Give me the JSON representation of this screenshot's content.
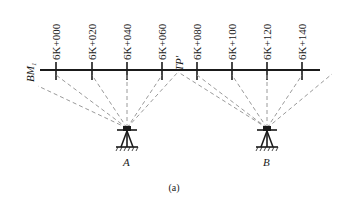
{
  "diagram": {
    "caption": "(a)",
    "benchmark_label": "BM",
    "benchmark_subscript": "1",
    "turning_point_label": "TP'",
    "stations": [
      {
        "label": "6K+000",
        "x": 56
      },
      {
        "label": "6K+020",
        "x": 92
      },
      {
        "label": "6K+040",
        "x": 127
      },
      {
        "label": "6K+060",
        "x": 162
      },
      {
        "label": "6K+080",
        "x": 197
      },
      {
        "label": "6K+100",
        "x": 232
      },
      {
        "label": "6K+120",
        "x": 267
      },
      {
        "label": "6K+140",
        "x": 302
      }
    ],
    "instruments": [
      {
        "label": "A",
        "x": 127,
        "y": 128
      },
      {
        "label": "B",
        "x": 267,
        "y": 128
      }
    ],
    "colors": {
      "line": "#1a1a1a",
      "sight_line": "#9a9a9a",
      "background": "#ffffff"
    }
  }
}
